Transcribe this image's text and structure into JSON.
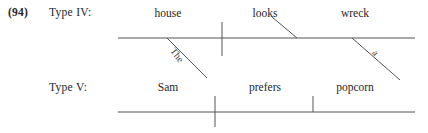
{
  "figure": {
    "example_number": "(94)",
    "rows": [
      {
        "id": "type-iv",
        "label": "Type IV:",
        "words": [
          {
            "text": "house",
            "x": 168
          },
          {
            "text": "looks",
            "x": 265
          },
          {
            "text": "wreck",
            "x": 355
          }
        ],
        "modifiers": [
          {
            "text": "The",
            "x": 176,
            "y": 46,
            "rotate": 52
          },
          {
            "text": "a",
            "x": 378,
            "y": 48,
            "rotate": 52
          }
        ]
      },
      {
        "id": "type-v",
        "label": "Type V:",
        "words": [
          {
            "text": "Sam",
            "x": 168
          },
          {
            "text": "prefers",
            "x": 265
          },
          {
            "text": "popcorn",
            "x": 355
          }
        ],
        "modifiers": []
      }
    ],
    "colors": {
      "line": "#555555",
      "text": "#262626",
      "background": "#ffffff"
    }
  }
}
